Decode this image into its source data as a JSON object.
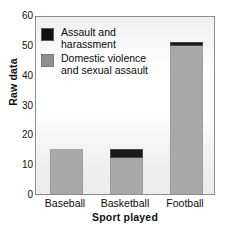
{
  "chart_data": {
    "type": "bar",
    "title": "",
    "subtitle": "",
    "xlabel": "Sport played",
    "ylabel": "Raw data",
    "categories": [
      "Baseball",
      "Basketball",
      "Football"
    ],
    "stacked": true,
    "series": [
      {
        "name": "Domestic violence and sexual assault",
        "color": "#a8a8a8",
        "values": [
          15,
          12,
          49.5
        ]
      },
      {
        "name": "Assault and harassment",
        "color": "#1a1a1a",
        "values": [
          0,
          3,
          1.5
        ]
      }
    ],
    "totals": [
      15,
      15,
      51
    ],
    "ylim": [
      0,
      60
    ],
    "yticks": [
      0,
      10,
      20,
      30,
      40,
      50,
      60
    ],
    "ytick_labels": [
      "0",
      "10",
      "20",
      "30",
      "40",
      "50",
      "60"
    ],
    "grid": false,
    "legend_position": "upper-left",
    "legend": [
      {
        "label": "Assault and\nharassment",
        "color": "#1a1a1a",
        "swatch": "black"
      },
      {
        "label": "Domestic violence\nand sexual assault",
        "color": "#8f8f8f",
        "swatch": "gray"
      }
    ]
  },
  "axes": {
    "y_title": "Raw data",
    "x_title": "Sport played",
    "y_ticks": [
      {
        "value": 60,
        "label": "60"
      },
      {
        "value": 50,
        "label": "50"
      },
      {
        "value": 40,
        "label": "40"
      },
      {
        "value": 30,
        "label": "30"
      },
      {
        "value": 20,
        "label": "20"
      },
      {
        "value": 10,
        "label": "10"
      },
      {
        "value": 0,
        "label": "0"
      }
    ],
    "x_ticks": [
      {
        "label": "Baseball"
      },
      {
        "label": "Basketball"
      },
      {
        "label": "Football"
      }
    ]
  },
  "legend": {
    "items": [
      {
        "label": "Assault and\nharassment"
      },
      {
        "label": "Domestic violence\nand sexual assault"
      }
    ]
  },
  "colors": {
    "bar_gray": "#a8a8a8",
    "bar_black": "#1a1a1a",
    "frame": "#8d8d8d",
    "text": "#0d0d0d"
  }
}
